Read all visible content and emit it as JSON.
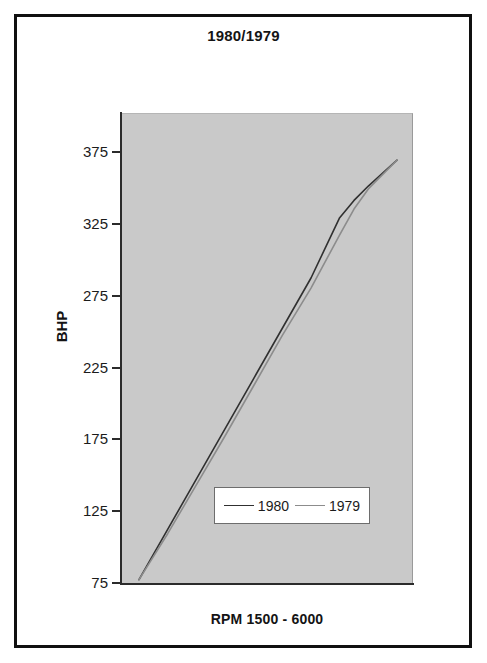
{
  "chart_title": "1980/1979",
  "y_axis_title": "BHP",
  "x_axis_title": "RPM 1500 - 6000",
  "legend": {
    "entries": [
      {
        "label": "1980",
        "color": "#303030",
        "swatch_name": "legend-line-1980"
      },
      {
        "label": "1979",
        "color": "#8c8c8c",
        "swatch_name": "legend-line-1979"
      }
    ]
  },
  "y_ticks": [
    {
      "label": "375",
      "value": 375
    },
    {
      "label": "325",
      "value": 325
    },
    {
      "label": "275",
      "value": 275
    },
    {
      "label": "225",
      "value": 225
    },
    {
      "label": "175",
      "value": 175
    },
    {
      "label": "125",
      "value": 125
    },
    {
      "label": "75",
      "value": 75
    }
  ],
  "colors": {
    "plot_background": "#c9c9c9",
    "page_background": "#ffffff",
    "frame": "#101010",
    "axis": "#2b2b2b",
    "series_1980": "#303030",
    "series_1979": "#8c8c8c"
  },
  "chart_data": {
    "type": "line",
    "title": "1980/1979",
    "xlabel": "RPM 1500 - 6000",
    "ylabel": "BHP",
    "xlim": [
      1500,
      6000
    ],
    "ylim": [
      75,
      400
    ],
    "ytick_values": [
      75,
      125,
      175,
      225,
      275,
      325,
      375
    ],
    "grid": false,
    "legend_position": "inside-lower-center",
    "x": [
      1500,
      2000,
      2500,
      3000,
      3500,
      4000,
      4500,
      5000,
      5250,
      5500,
      6000
    ],
    "series": [
      {
        "name": "1980",
        "color": "#303030",
        "values": [
          78,
          113,
          148,
          183,
          218,
          253,
          288,
          330,
          342,
          352,
          370
        ]
      },
      {
        "name": "1979",
        "color": "#8c8c8c",
        "values": [
          78,
          110,
          144,
          178,
          213,
          248,
          281,
          318,
          336,
          350,
          370
        ]
      }
    ]
  }
}
